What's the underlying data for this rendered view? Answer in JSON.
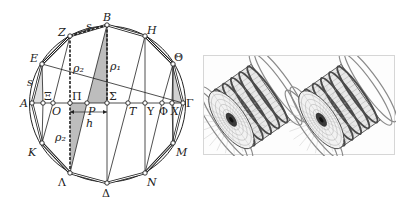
{
  "figure": {
    "left_panel": {
      "title": "Inscribed 16-gon construction diagram",
      "circle": {
        "cx": 107.5,
        "cy": 104,
        "r": 78
      },
      "vertices": [
        {
          "id": "A",
          "label": "A",
          "x": 32,
          "y": 103,
          "lx": 20,
          "ly": 107
        },
        {
          "id": "E",
          "label": "E",
          "x": 42,
          "y": 64,
          "lx": 30,
          "ly": 62
        },
        {
          "id": "Z",
          "label": "Z",
          "x": 70,
          "y": 36,
          "lx": 58,
          "ly": 36
        },
        {
          "id": "B",
          "label": "B",
          "x": 107,
          "y": 25,
          "lx": 103,
          "ly": 21
        },
        {
          "id": "H",
          "label": "H",
          "x": 145,
          "y": 36,
          "lx": 147,
          "ly": 34
        },
        {
          "id": "Theta",
          "label": "Θ",
          "x": 173,
          "y": 64,
          "lx": 174,
          "ly": 61
        },
        {
          "id": "Gamma",
          "label": "Γ",
          "x": 183,
          "y": 103,
          "lx": 186,
          "ly": 107
        },
        {
          "id": "M",
          "label": "M",
          "x": 173,
          "y": 143,
          "lx": 176,
          "ly": 156
        },
        {
          "id": "N",
          "label": "N",
          "x": 145,
          "y": 173,
          "lx": 147,
          "ly": 186
        },
        {
          "id": "Delta",
          "label": "Δ",
          "x": 107,
          "y": 183,
          "lx": 102,
          "ly": 197
        },
        {
          "id": "Lambda",
          "label": "Λ",
          "x": 70,
          "y": 173,
          "lx": 58,
          "ly": 186
        },
        {
          "id": "K",
          "label": "K",
          "x": 42,
          "y": 143,
          "lx": 28,
          "ly": 156
        }
      ],
      "axis_points": [
        {
          "id": "Xi",
          "label": "Ξ",
          "x": 43,
          "y": 103,
          "lx": 44,
          "ly": 100
        },
        {
          "id": "O",
          "label": "O",
          "x": 53,
          "y": 103,
          "lx": 52,
          "ly": 115
        },
        {
          "id": "Pi",
          "label": "Π",
          "x": 70,
          "y": 103,
          "lx": 72,
          "ly": 100
        },
        {
          "id": "P",
          "label": "P",
          "x": 87,
          "y": 103,
          "lx": 88,
          "ly": 115
        },
        {
          "id": "Sigma",
          "label": "Σ",
          "x": 107,
          "y": 103,
          "lx": 109,
          "ly": 100
        },
        {
          "id": "T",
          "label": "T",
          "x": 128,
          "y": 103,
          "lx": 129,
          "ly": 115
        },
        {
          "id": "Upsilon",
          "label": "Υ",
          "x": 145,
          "y": 103,
          "lx": 147,
          "ly": 115
        },
        {
          "id": "Phi",
          "label": "Φ",
          "x": 162,
          "y": 103,
          "lx": 159,
          "ly": 115
        },
        {
          "id": "Chi",
          "label": "X",
          "x": 172,
          "y": 103,
          "lx": 171,
          "ly": 115
        }
      ],
      "annotations": [
        {
          "id": "s_top",
          "text": "s",
          "x": 86,
          "y": 30
        },
        {
          "id": "s_left",
          "text": "s",
          "x": 27,
          "y": 86
        },
        {
          "id": "rho1",
          "text": "ρ₁",
          "x": 110,
          "y": 70
        },
        {
          "id": "rho2_top",
          "text": "ρ₂",
          "x": 73,
          "y": 72
        },
        {
          "id": "rho2_bottom",
          "text": "ρ₂",
          "x": 55,
          "y": 141
        },
        {
          "id": "h",
          "text": "h",
          "x": 86,
          "y": 127
        }
      ]
    },
    "right_panel": {
      "title": "Two wireframe cylindrical coil renderings",
      "items": [
        {
          "id": "coil-left",
          "cx": 250,
          "cy": 105
        },
        {
          "id": "coil-right",
          "cx": 340,
          "cy": 105
        }
      ]
    },
    "colors": {
      "line": "#222222",
      "shade": "#bdbdbd",
      "frame": "#d6d6d6",
      "coil_dark": "#4a4a4a",
      "coil_mid": "#8a8a8a"
    }
  }
}
